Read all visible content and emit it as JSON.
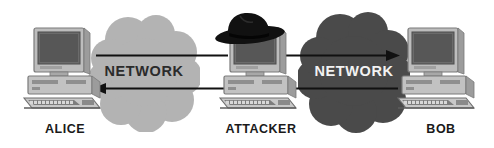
{
  "diagram": {
    "background_color": "#ffffff"
  },
  "clouds": [
    {
      "id": "left-network-cloud",
      "label": "NETWORK",
      "fill": "#b3b3b3",
      "text_color": "#2b2b2b",
      "style": "light"
    },
    {
      "id": "right-network-cloud",
      "label": "NETWORK",
      "fill": "#4a4a4a",
      "text_color": "#f2f2f2",
      "style": "dark"
    }
  ],
  "nodes": [
    {
      "id": "alice",
      "label": "ALICE",
      "icon": "desktop-computer-icon",
      "has_hat": false
    },
    {
      "id": "attacker",
      "label": "ATTACKER",
      "icon": "desktop-computer-icon",
      "has_hat": true,
      "hat_icon": "black-fedora-hat-icon",
      "hat_color": "#111111"
    },
    {
      "id": "bob",
      "label": "BOB",
      "icon": "desktop-computer-icon",
      "has_hat": false
    }
  ],
  "arrows": [
    {
      "id": "alice-to-attacker",
      "direction": "right",
      "from": "alice",
      "to": "attacker",
      "color": "#111111"
    },
    {
      "id": "attacker-to-alice",
      "direction": "left",
      "from": "attacker",
      "to": "alice",
      "color": "#111111"
    },
    {
      "id": "attacker-to-bob",
      "direction": "right",
      "from": "attacker",
      "to": "bob",
      "color": "#111111"
    },
    {
      "id": "bob-to-attacker",
      "direction": "left",
      "from": "bob",
      "to": "attacker",
      "color": "#111111"
    }
  ]
}
